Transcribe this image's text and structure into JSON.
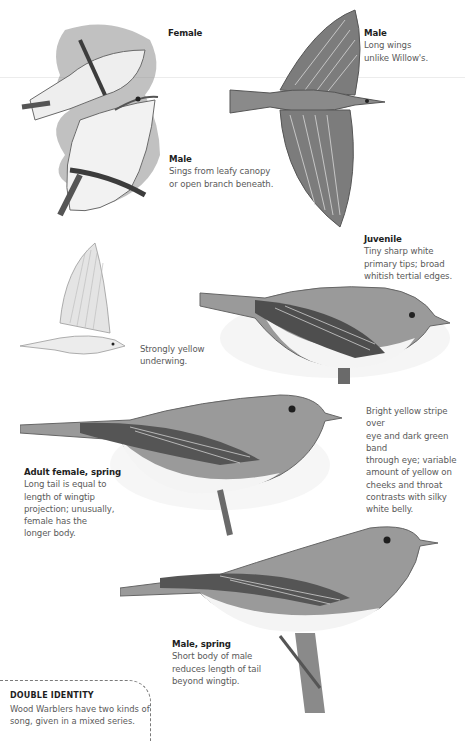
{
  "page": {
    "style": "grayscale field-guide plate",
    "colors": {
      "background": "#ffffff",
      "title_text": "#1e1e1e",
      "body_text": "#5a5a5a",
      "bird_dark": "#4a4a4a",
      "bird_mid": "#8a8a8a",
      "bird_light": "#e6e6e6"
    }
  },
  "captions": [
    {
      "id": "female",
      "title": "Female",
      "body": ""
    },
    {
      "id": "male-flight",
      "title": "Male",
      "body": "Long wings\nunlike Willow's."
    },
    {
      "id": "male-singing",
      "title": "Male",
      "body": "Sings from leafy canopy\nor open branch beneath."
    },
    {
      "id": "juvenile",
      "title": "Juvenile",
      "body": "Tiny sharp white\nprimary tips; broad\nwhitish tertial edges."
    },
    {
      "id": "underwing",
      "title": "",
      "body": "Strongly yellow\nunderwing."
    },
    {
      "id": "eye-stripe",
      "title": "",
      "body": "Bright yellow stripe over\neye and dark green band\nthrough eye; variable\namount of yellow on\ncheeks and throat\ncontrasts with silky\nwhite belly."
    },
    {
      "id": "adult-female",
      "title": "Adult female, spring",
      "body": "Long tail is equal to\nlength of wingtip\nprojection; unusually,\nfemale has the\nlonger body."
    },
    {
      "id": "male-spring",
      "title": "Male, spring",
      "body": "Short body of male\nreduces length of tail\nbeyond wingtip."
    }
  ],
  "sidebar_box": {
    "title": "DOUBLE IDENTITY",
    "body": "Wood Warblers have two kinds of\nsong, given in a mixed series."
  },
  "illustrations": [
    {
      "id": "pair-display",
      "label": "female and singing male among leaves"
    },
    {
      "id": "flight-top",
      "label": "male in flight from above"
    },
    {
      "id": "juvenile-perched",
      "label": "juvenile perched"
    },
    {
      "id": "flight-side",
      "label": "bird in flight showing underwing"
    },
    {
      "id": "adult-female-perched",
      "label": "adult female perched"
    },
    {
      "id": "male-spring-perched",
      "label": "male perched on branch"
    }
  ]
}
